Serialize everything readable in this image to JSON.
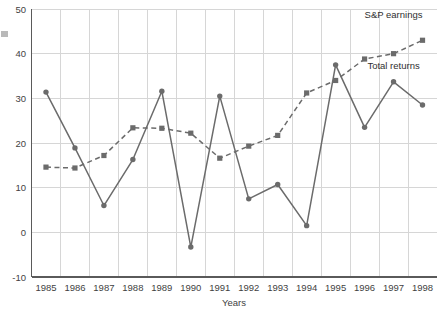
{
  "chart_data": {
    "type": "line",
    "title": "",
    "subtitle": "",
    "xlabel": "Years",
    "ylabel": "",
    "categories": [
      "1985",
      "1986",
      "1987",
      "1988",
      "1989",
      "1990",
      "1991",
      "1992",
      "1993",
      "1994",
      "1995",
      "1996",
      "1997",
      "1998"
    ],
    "x": [
      1985,
      1986,
      1987,
      1988,
      1989,
      1990,
      1991,
      1992,
      1993,
      1994,
      1995,
      1996,
      1997,
      1998
    ],
    "xlim": [
      1984.5,
      1998.5
    ],
    "ylim": [
      -10,
      50
    ],
    "yticks": [
      -10,
      0,
      10,
      20,
      30,
      40,
      50
    ],
    "ytick_labels": [
      "-10",
      "0",
      "10",
      "20",
      "30",
      "40",
      "50"
    ],
    "grid": true,
    "legend_position": "inline-right",
    "series": [
      {
        "name": "Total returns",
        "style": "solid",
        "marker": "circle",
        "color": "#6b6b6b",
        "values": [
          31.4,
          18.9,
          6.0,
          16.3,
          31.6,
          -3.3,
          30.5,
          7.5,
          10.7,
          1.5,
          37.5,
          23.5,
          33.7,
          28.5
        ]
      },
      {
        "name": "S&P earnings",
        "style": "dashed",
        "marker": "square",
        "color": "#6b6b6b",
        "values": [
          14.6,
          14.4,
          17.2,
          23.4,
          23.3,
          22.2,
          16.6,
          19.3,
          21.7,
          31.2,
          34.0,
          38.8,
          40.0,
          43.0
        ]
      }
    ],
    "annotations": [
      {
        "text": "S&P earnings",
        "x": 1997.0,
        "y": 48.0
      },
      {
        "text": "Total returns",
        "x": 1996.6,
        "y": 36.5
      }
    ]
  },
  "axes": {
    "x_axis_title": "Years",
    "x_tick_labels": [
      "1985",
      "1986",
      "1987",
      "1988",
      "1989",
      "1990",
      "1991",
      "1992",
      "1993",
      "1994",
      "1995",
      "1996",
      "1997",
      "1998"
    ],
    "y_tick_labels": [
      "50",
      "40",
      "30",
      "20",
      "10",
      "0",
      "-10"
    ]
  },
  "colors": {
    "line": "#6b6b6b",
    "grid": "#d6d6d6",
    "axis": "#5a5a5a",
    "text": "#3f3f3f",
    "background": "#ffffff"
  }
}
